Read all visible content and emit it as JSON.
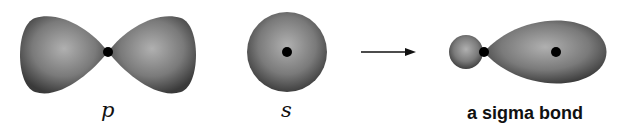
{
  "diagram": {
    "elements": [
      {
        "id": "p-orbital",
        "shape": "dumbbell",
        "label": "p"
      },
      {
        "id": "s-orbital",
        "shape": "sphere",
        "label": "s"
      },
      {
        "id": "arrow",
        "shape": "right-arrow"
      },
      {
        "id": "sigma-bond",
        "shape": "overlap-lobe",
        "label": "a sigma bond"
      }
    ],
    "labels": {
      "p": "p",
      "s": "s",
      "sigma": "a sigma bond"
    },
    "colors": {
      "lobe_dark": "#3a3a3a",
      "lobe_light": "#a8a8a8",
      "nucleus": "#000000"
    }
  }
}
